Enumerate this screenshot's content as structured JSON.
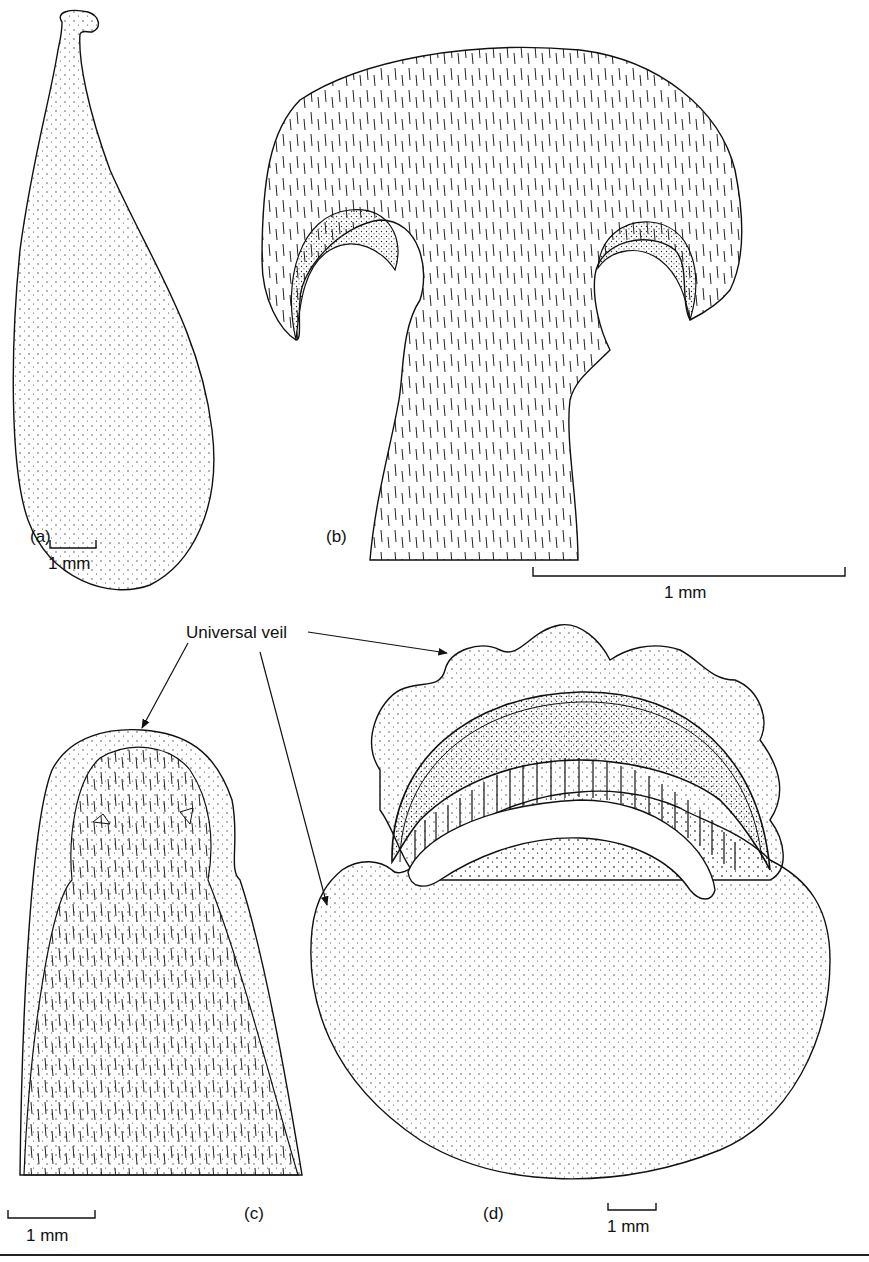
{
  "figure": {
    "panels": [
      {
        "id": "a",
        "label": "(a)",
        "scale_bar": "1 mm"
      },
      {
        "id": "b",
        "label": "(b)",
        "scale_bar": "1 mm"
      },
      {
        "id": "c",
        "label": "(c)",
        "scale_bar": "1 mm"
      },
      {
        "id": "d",
        "label": "(d)",
        "scale_bar": "1 mm"
      }
    ],
    "annotations": {
      "universal_veil": "Universal veil"
    }
  }
}
